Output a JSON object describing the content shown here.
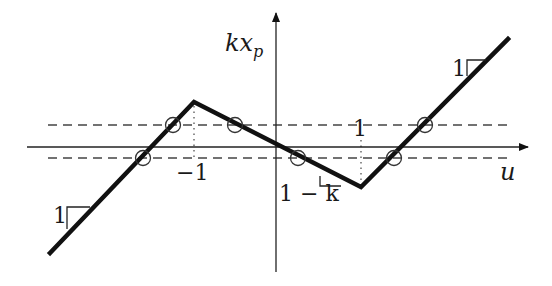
{
  "figure": {
    "y_axis_label": "kx",
    "y_axis_label_sub": "p",
    "x_axis_label": "u",
    "tick_neg_one": "−1",
    "tick_pos_one": "1",
    "slope_middle_label": "1 − k",
    "slope_left_label": "1",
    "slope_right_label": "1",
    "curve_description": "Piecewise-linear function: slope 1 for u < −1, slope −(1−k) between −1 and 1, slope 1 for u > 1",
    "breakpoints_u": [
      -1,
      1
    ],
    "dashed_levels": [
      "upper",
      "lower"
    ],
    "circle_markers_count": 6,
    "colors": {
      "curve": "#111111",
      "axis": "#222222",
      "dashed": "#444444",
      "dotted": "#555555"
    }
  }
}
